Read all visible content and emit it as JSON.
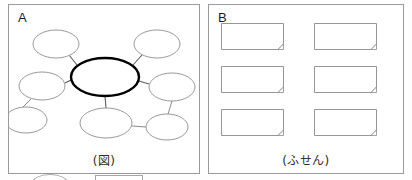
{
  "page": {
    "background_color": "#ffffff",
    "width": 412,
    "height": 180
  },
  "panels": [
    {
      "id": "a",
      "label": "A",
      "caption": "(図)",
      "kind": "concept-map-diagram"
    },
    {
      "id": "b",
      "label": "B",
      "caption": "(ふせん)",
      "kind": "sticky-note-grid"
    }
  ],
  "diagram": {
    "stroke_color": "#8d8d8d",
    "center_stroke_color": "#000000",
    "nodes": [
      {
        "id": "center",
        "role": "central-topic",
        "cx": 96,
        "cy": 58,
        "rx": 34,
        "ry": 19,
        "emphasis": true
      },
      {
        "id": "top-left",
        "role": "branch",
        "cx": 47,
        "cy": 25,
        "rx": 23,
        "ry": 14,
        "emphasis": false
      },
      {
        "id": "top-right",
        "role": "branch",
        "cx": 148,
        "cy": 25,
        "rx": 23,
        "ry": 14,
        "emphasis": false
      },
      {
        "id": "mid-left",
        "role": "branch",
        "cx": 33,
        "cy": 67,
        "rx": 23,
        "ry": 14,
        "emphasis": false
      },
      {
        "id": "mid-right",
        "role": "branch",
        "cx": 163,
        "cy": 68,
        "rx": 23,
        "ry": 14,
        "emphasis": false
      },
      {
        "id": "bottom-mid",
        "role": "branch",
        "cx": 97,
        "cy": 104,
        "rx": 26,
        "ry": 15,
        "emphasis": false
      },
      {
        "id": "lower-left",
        "role": "sub-branch",
        "cx": 17,
        "cy": 101,
        "rx": 21,
        "ry": 13,
        "emphasis": false
      },
      {
        "id": "lower-right",
        "role": "sub-branch",
        "cx": 158,
        "cy": 108,
        "rx": 21,
        "ry": 13,
        "emphasis": false
      }
    ],
    "links": [
      {
        "from": "center",
        "to": "top-left",
        "x1": 68,
        "y1": 46,
        "x2": 60,
        "y2": 36,
        "primary": true
      },
      {
        "from": "center",
        "to": "top-right",
        "x1": 124,
        "y1": 46,
        "x2": 133,
        "y2": 36,
        "primary": true
      },
      {
        "from": "center",
        "to": "mid-left",
        "x1": 62,
        "y1": 61,
        "x2": 56,
        "y2": 64,
        "primary": true
      },
      {
        "from": "center",
        "to": "mid-right",
        "x1": 130,
        "y1": 62,
        "x2": 140,
        "y2": 65,
        "primary": true
      },
      {
        "from": "center",
        "to": "bottom-mid",
        "x1": 96,
        "y1": 77,
        "x2": 97,
        "y2": 89,
        "primary": true
      },
      {
        "from": "mid-left",
        "to": "lower-left",
        "x1": 22,
        "y1": 80,
        "x2": 14,
        "y2": 88,
        "primary": false
      },
      {
        "from": "mid-right",
        "to": "lower-right",
        "x1": 163,
        "y1": 82,
        "x2": 159,
        "y2": 95,
        "primary": false
      },
      {
        "from": "bottom-mid",
        "to": "lower-right",
        "x1": 123,
        "y1": 107,
        "x2": 137,
        "y2": 108,
        "primary": false
      }
    ]
  },
  "notes": {
    "rows": 3,
    "columns": 2,
    "stroke_color": "#8a8a8a",
    "fill_color": "#ffffff",
    "has_folded_corner": true,
    "items": [
      {
        "id": "note-1",
        "x": 12,
        "y": 2,
        "row": 1,
        "col": 1
      },
      {
        "id": "note-2",
        "x": 105,
        "y": 2,
        "row": 1,
        "col": 2
      },
      {
        "id": "note-3",
        "x": 12,
        "y": 45,
        "row": 2,
        "col": 1
      },
      {
        "id": "note-4",
        "x": 105,
        "y": 45,
        "row": 2,
        "col": 2
      },
      {
        "id": "note-5",
        "x": 12,
        "y": 88,
        "row": 3,
        "col": 1
      },
      {
        "id": "note-6",
        "x": 105,
        "y": 88,
        "row": 3,
        "col": 2
      }
    ]
  },
  "bottom_strip": {
    "visible": true,
    "note": "partially cropped shapes from the next row",
    "shapes": [
      "ellipse",
      "rectangle"
    ]
  }
}
